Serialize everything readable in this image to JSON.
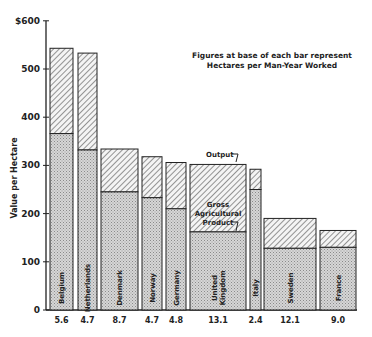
{
  "chart_data": {
    "type": "bar",
    "stacked": true,
    "title": "",
    "xlabel": "",
    "ylabel": "Value per Hectare",
    "ylim": [
      0,
      600
    ],
    "yticks": [
      0,
      100,
      200,
      300,
      400,
      500,
      600
    ],
    "ytick_labels": [
      "0",
      "100",
      "200",
      "300",
      "400",
      "500",
      "$600"
    ],
    "grid": false,
    "note": [
      "Figures at base of each bar represent",
      "Hectares per Man-Year Worked"
    ],
    "annotations": {
      "output": "Output",
      "gap": [
        "Gross",
        "Agricultural",
        "Product"
      ]
    },
    "categories": [
      "Belgium",
      "Netherlands",
      "Denmark",
      "Norway",
      "Germany",
      "United Kingdom",
      "Italy",
      "Sweden",
      "France"
    ],
    "category_label_lines": [
      [
        "Belgium"
      ],
      [
        "Netherlands"
      ],
      [
        "Denmark"
      ],
      [
        "Norway"
      ],
      [
        "Germany"
      ],
      [
        "United",
        "Kingdom"
      ],
      [
        "Italy"
      ],
      [
        "Sweden"
      ],
      [
        "France"
      ]
    ],
    "hectares_per_man_year": [
      "5.6",
      "4.7",
      "8.7",
      "4.7",
      "4.8",
      "13.1",
      "2.4",
      "12.1",
      "9.0"
    ],
    "series": [
      {
        "name": "Gross Agricultural Product",
        "pattern": "stipple",
        "values": [
          366,
          332,
          245,
          233,
          210,
          162,
          250,
          128,
          130
        ]
      },
      {
        "name": "Output",
        "pattern": "hatch",
        "values": [
          543,
          533,
          334,
          318,
          306,
          302,
          292,
          190,
          165
        ]
      }
    ],
    "bar_widths_relative_to_hectares": true
  },
  "colors": {
    "ink": "#222222",
    "stipple": "#c9c9c9",
    "hatch_bg": "#f2f2f2"
  }
}
